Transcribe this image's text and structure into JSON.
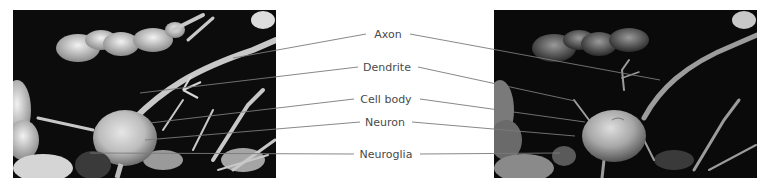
{
  "figure": {
    "left_image": {
      "description": "scanning electron micrograph of a neuron and neuroglia (grayscale)"
    },
    "right_image": {
      "description": "colorized/shaded scanning electron micrograph of the same neuron"
    },
    "labels": [
      {
        "id": "axon",
        "text": "Axon",
        "x": 388,
        "y": 34
      },
      {
        "id": "dendrite",
        "text": "Dendrite",
        "x": 387,
        "y": 67
      },
      {
        "id": "cell-body",
        "text": "Cell body",
        "x": 386,
        "y": 99
      },
      {
        "id": "neuron",
        "text": "Neuron",
        "x": 385,
        "y": 122
      },
      {
        "id": "neuroglia",
        "text": "Neuroglia",
        "x": 386,
        "y": 154
      }
    ],
    "line_color": "#7a7a7a",
    "label_color": "#4a4a4a"
  }
}
